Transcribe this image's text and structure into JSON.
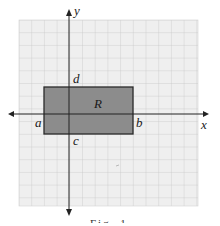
{
  "figure": {
    "type": "coordinate-plane-region",
    "axes": {
      "x_label": "x",
      "y_label": "y"
    },
    "region": {
      "label": "R",
      "corner_labels": {
        "left": "a",
        "right": "b",
        "bottom": "c",
        "top": "d"
      },
      "fill_color": "#8c8c8c",
      "border_color": "#2a2a2a"
    },
    "grid": {
      "line_color": "#c8c8c8",
      "background_color": "#efefef"
    },
    "caption": "Fig. 1"
  }
}
